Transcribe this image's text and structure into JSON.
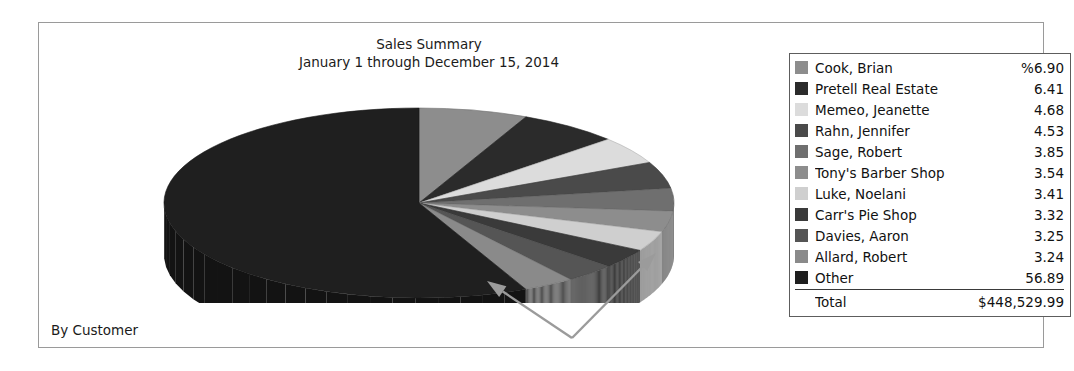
{
  "report": {
    "title": "Sales Summary",
    "subtitle": "January 1 through December 15, 2014",
    "footer_label": "By Customer"
  },
  "legend": {
    "total_label": "Total",
    "total_value": "$448,529.99",
    "rows": [
      {
        "label": "Cook, Brian",
        "value": "%6.90",
        "color": "#8d8d8d"
      },
      {
        "label": "Pretell Real Estate",
        "value": "6.41",
        "color": "#2b2b2b"
      },
      {
        "label": "Memeo, Jeanette",
        "value": "4.68",
        "color": "#dcdcdc"
      },
      {
        "label": "Rahn, Jennifer",
        "value": "4.53",
        "color": "#4a4a4a"
      },
      {
        "label": "Sage, Robert",
        "value": "3.85",
        "color": "#6f6f6f"
      },
      {
        "label": "Tony's Barber Shop",
        "value": "3.54",
        "color": "#8d8d8d"
      },
      {
        "label": "Luke, Noelani",
        "value": "3.41",
        "color": "#cfcfcf"
      },
      {
        "label": "Carr's Pie Shop",
        "value": "3.32",
        "color": "#3a3a3a"
      },
      {
        "label": "Davies, Aaron",
        "value": "3.25",
        "color": "#555555"
      },
      {
        "label": "Allard, Robert",
        "value": "3.24",
        "color": "#8a8a8a"
      },
      {
        "label": "Other",
        "value": "56.89",
        "color": "#1f1f1f"
      }
    ]
  },
  "chart_data": {
    "type": "pie",
    "title": "Sales Summary",
    "subtitle": "January 1 through December 15, 2014",
    "grouping": "By Customer",
    "value_unit": "percent",
    "total": "$448,529.99",
    "legend_position": "right",
    "three_d": true,
    "labels": [
      "Cook, Brian",
      "Pretell Real Estate",
      "Memeo, Jeanette",
      "Rahn, Jennifer",
      "Sage, Robert",
      "Tony's Barber Shop",
      "Luke, Noelani",
      "Carr's Pie Shop",
      "Davies, Aaron",
      "Allard, Robert",
      "Other"
    ],
    "values": [
      6.9,
      6.41,
      4.68,
      4.53,
      3.85,
      3.54,
      3.41,
      3.32,
      3.25,
      3.24,
      56.89
    ],
    "colors": [
      "#8d8d8d",
      "#2b2b2b",
      "#dcdcdc",
      "#4a4a4a",
      "#6f6f6f",
      "#8d8d8d",
      "#cfcfcf",
      "#3a3a3a",
      "#555555",
      "#8a8a8a",
      "#1f1f1f"
    ]
  },
  "annotations": {
    "arrow_color": "#9b9b9b",
    "arrows": [
      {
        "name": "callout-arrow-left",
        "from_x": 572,
        "from_y": 338,
        "to_x": 487,
        "to_y": 281
      },
      {
        "name": "callout-arrow-right",
        "from_x": 572,
        "from_y": 338,
        "to_x": 656,
        "to_y": 253
      }
    ]
  }
}
